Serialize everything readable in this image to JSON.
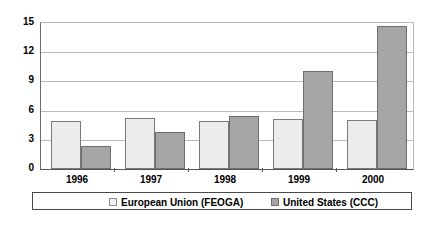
{
  "chart_data": {
    "type": "bar",
    "title": "",
    "subtitle": "",
    "xlabel": "",
    "ylabel": "",
    "categories": [
      "1996",
      "1997",
      "1998",
      "1999",
      "2000"
    ],
    "series": [
      {
        "name": "European Union (FEOGA)",
        "color": "#ececec",
        "values": [
          4.9,
          5.2,
          4.9,
          5.1,
          5.0
        ]
      },
      {
        "name": "United States (CCC)",
        "color": "#a6a6a6",
        "values": [
          2.4,
          3.8,
          5.4,
          10.1,
          14.7
        ]
      }
    ],
    "ylim": [
      0,
      15
    ],
    "yticks": [
      0,
      3,
      6,
      9,
      12,
      15
    ],
    "ytick_labels": [
      "0",
      "3",
      "6",
      "9",
      "12",
      "15"
    ],
    "grid": true,
    "grid_axis": "y",
    "legend_position": "bottom"
  },
  "legend": {
    "entries": [
      {
        "label": "European Union (FEOGA)",
        "swatch": "legend-swatch-eu"
      },
      {
        "label": "United States (CCC)",
        "swatch": "legend-swatch-us"
      }
    ]
  }
}
